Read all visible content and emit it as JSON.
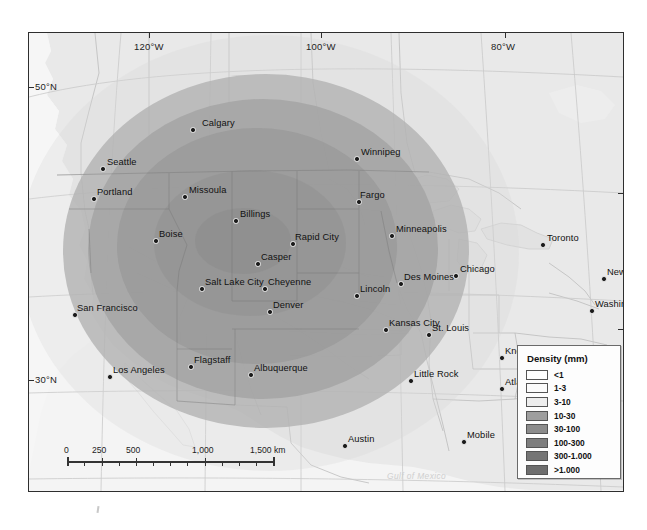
{
  "map": {
    "title": "Volcanic ash density distribution map of western North America",
    "projection_note": "Lambert conformal, western/central North America",
    "frame": {
      "left": 28,
      "top": 32,
      "width": 594,
      "height": 458
    },
    "background_colors": {
      "ocean": "#f4f4f4",
      "land": "#e8e8e8",
      "frame_border": "#2e2e2e",
      "graticule": "#c9c9c9"
    },
    "graticule_labels": [
      {
        "text": "120°W",
        "x": 105,
        "y": 40,
        "type": "longitude"
      },
      {
        "text": "100°W",
        "x": 290,
        "y": 40,
        "type": "longitude"
      },
      {
        "text": "80°W",
        "x": 473,
        "y": 40,
        "type": "longitude"
      },
      {
        "text": "50°N",
        "x": 31,
        "y": 75,
        "type": "latitude"
      },
      {
        "text": "30°N",
        "x": 31,
        "y": 368,
        "type": "latitude"
      }
    ],
    "cities": [
      {
        "name": "Calgary",
        "x": 163,
        "y": 96,
        "lx": 10,
        "ly": -11
      },
      {
        "name": "Seattle",
        "x": 73,
        "y": 135,
        "lx": 5,
        "ly": -11
      },
      {
        "name": "Portland",
        "x": 64,
        "y": 165,
        "lx": 4,
        "ly": -11
      },
      {
        "name": "Winnipeg",
        "x": 327,
        "y": 125,
        "lx": 5,
        "ly": -11
      },
      {
        "name": "Missoula",
        "x": 155,
        "y": 163,
        "lx": 5,
        "ly": -11
      },
      {
        "name": "Billings",
        "x": 206,
        "y": 187,
        "lx": 5,
        "ly": -11
      },
      {
        "name": "Fargo",
        "x": 329,
        "y": 168,
        "lx": 2,
        "ly": -11
      },
      {
        "name": "Boise",
        "x": 126,
        "y": 207,
        "lx": 4,
        "ly": -11
      },
      {
        "name": "Rapid City",
        "x": 263,
        "y": 210,
        "lx": 3,
        "ly": -11
      },
      {
        "name": "Minneapolis",
        "x": 362,
        "y": 202,
        "lx": 5,
        "ly": -11
      },
      {
        "name": "Toronto",
        "x": 513,
        "y": 211,
        "lx": 5,
        "ly": -11
      },
      {
        "name": "Casper",
        "x": 228,
        "y": 230,
        "lx": 4,
        "ly": -11
      },
      {
        "name": "Des Moines",
        "x": 371,
        "y": 250,
        "lx": 4,
        "ly": -11
      },
      {
        "name": "Chicago",
        "x": 426,
        "y": 242,
        "lx": 5,
        "ly": -11
      },
      {
        "name": "New York",
        "x": 574,
        "y": 245,
        "lx": 4,
        "ly": -11
      },
      {
        "name": "Salt Lake City",
        "x": 172,
        "y": 255,
        "lx": 4,
        "ly": -11
      },
      {
        "name": "Cheyenne",
        "x": 235,
        "y": 255,
        "lx": 4,
        "ly": -11
      },
      {
        "name": "Lincoln",
        "x": 327,
        "y": 262,
        "lx": 4,
        "ly": -11
      },
      {
        "name": "Denver",
        "x": 240,
        "y": 278,
        "lx": 4,
        "ly": -11
      },
      {
        "name": "Washington, D.C.",
        "x": 562,
        "y": 277,
        "lx": 4,
        "ly": -11
      },
      {
        "name": "San Francisco",
        "x": 45,
        "y": 281,
        "lx": 3,
        "ly": -11
      },
      {
        "name": "Kansas City",
        "x": 356,
        "y": 296,
        "lx": 4,
        "ly": -11
      },
      {
        "name": "St. Louis",
        "x": 399,
        "y": 301,
        "lx": 4,
        "ly": -11
      },
      {
        "name": "Knoxville",
        "x": 472,
        "y": 324,
        "lx": 4,
        "ly": -11
      },
      {
        "name": "Raleigh",
        "x": 528,
        "y": 330,
        "lx": 4,
        "ly": -11
      },
      {
        "name": "Flagstaff",
        "x": 161,
        "y": 333,
        "lx": 4,
        "ly": -11
      },
      {
        "name": "Albuquerque",
        "x": 221,
        "y": 341,
        "lx": 4,
        "ly": -11
      },
      {
        "name": "Los Angeles",
        "x": 80,
        "y": 343,
        "lx": 4,
        "ly": -11
      },
      {
        "name": "Little Rock",
        "x": 381,
        "y": 347,
        "lx": 4,
        "ly": -11
      },
      {
        "name": "Atlanta",
        "x": 472,
        "y": 355,
        "lx": 4,
        "ly": -11
      },
      {
        "name": "Mobile",
        "x": 434,
        "y": 408,
        "lx": 4,
        "ly": -11
      },
      {
        "name": "Austin",
        "x": 315,
        "y": 412,
        "lx": 4,
        "ly": -11
      }
    ],
    "region_labels": [
      {
        "text": "M E X I C O",
        "x": 172,
        "y": 463
      },
      {
        "text": "Gulf of Mexico",
        "x": 385,
        "y": 478
      }
    ],
    "scale_bar": {
      "unit": "km",
      "labels": [
        "0",
        "250",
        "500",
        "1,000",
        "1,500 km"
      ],
      "positions": [
        0,
        35,
        69,
        138,
        207
      ]
    }
  },
  "legend": {
    "title": "Density (mm)",
    "items": [
      {
        "label": "<1",
        "color": "#ffffff"
      },
      {
        "label": "1-3",
        "color": "#fbfbfb"
      },
      {
        "label": "3-10",
        "color": "#ededed"
      },
      {
        "label": "10-30",
        "color": "#9e9e9e"
      },
      {
        "label": "30-100",
        "color": "#8c8c8c"
      },
      {
        "label": "100-300",
        "color": "#7e7e7e"
      },
      {
        "label": "300-1.000",
        "color": "#757575"
      },
      {
        "label": ">1.000",
        "color": "#6e6e6e"
      }
    ]
  },
  "chart_data": {
    "type": "heatmap",
    "title": "Density (mm)",
    "xlabel": "Longitude",
    "ylabel": "Latitude",
    "xlim": [
      -130,
      -72
    ],
    "ylim": [
      25,
      54
    ],
    "x_ticks": [
      "120°W",
      "100°W",
      "80°W"
    ],
    "y_ticks": [
      "50°N",
      "30°N"
    ],
    "grid": true,
    "legend_position": "bottom-right",
    "colorbar_classes": [
      {
        "range": "<1",
        "min": 0,
        "max": 1,
        "color": "#ffffff"
      },
      {
        "range": "1-3",
        "min": 1,
        "max": 3,
        "color": "#fbfbfb"
      },
      {
        "range": "3-10",
        "min": 3,
        "max": 10,
        "color": "#ededed"
      },
      {
        "range": "10-30",
        "min": 10,
        "max": 30,
        "color": "#9e9e9e"
      },
      {
        "range": "30-100",
        "min": 30,
        "max": 100,
        "color": "#8c8c8c"
      },
      {
        "range": "100-300",
        "min": 100,
        "max": 300,
        "color": "#7e7e7e"
      },
      {
        "range": "300-1.000",
        "min": 300,
        "max": 1000,
        "color": "#757575"
      },
      {
        "range": ">1.000",
        "min": 1000,
        "max": null,
        "color": "#6e6e6e"
      }
    ],
    "contours": [
      {
        "class": "10-30",
        "center_x": 237,
        "center_y": 218,
        "rx": 203,
        "ry": 177
      },
      {
        "class": "30-100",
        "center_x": 234,
        "center_y": 216,
        "rx": 175,
        "ry": 150
      },
      {
        "class": "100-300",
        "center_x": 228,
        "center_y": 213,
        "rx": 140,
        "ry": 118
      },
      {
        "class": "300-1.000",
        "center_x": 221,
        "center_y": 210,
        "rx": 96,
        "ry": 73
      },
      {
        "class": ">1.000",
        "center_x": 214,
        "center_y": 208,
        "rx": 48,
        "ry": 33
      }
    ]
  }
}
